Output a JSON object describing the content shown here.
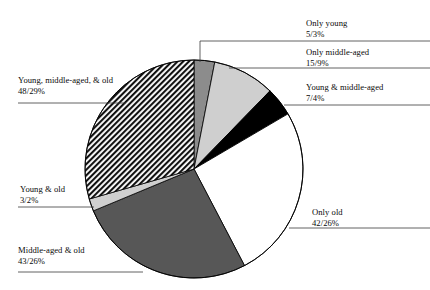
{
  "chart_data": {
    "type": "pie",
    "title": "",
    "total": 163,
    "value_format": "count/percent",
    "legend": "callout-labels",
    "grid": false,
    "categories": [
      "Only young",
      "Only middle-aged",
      "Young & middle-aged",
      "Only old",
      "Middle-aged & old",
      "Young & old",
      "Young, middle-aged, & old"
    ],
    "values": [
      5,
      15,
      7,
      42,
      43,
      3,
      48
    ],
    "percents": [
      3,
      9,
      4,
      26,
      26,
      2,
      29
    ],
    "value_labels": [
      "5/3%",
      "15/9%",
      "7/4%",
      "42/26%",
      "43/26%",
      "3/2%",
      "48/29%"
    ],
    "slices": [
      {
        "label": "Only young",
        "value": 5,
        "percent": 3,
        "value_label": "5/3%",
        "fill": "#8c8c8c",
        "pattern": "solid",
        "start_angle": 0,
        "end_angle": 11.0
      },
      {
        "label": "Only middle-aged",
        "value": 15,
        "percent": 9,
        "value_label": "15/9%",
        "fill": "#cfcfcf",
        "pattern": "solid",
        "start_angle": 11.0,
        "end_angle": 44.2
      },
      {
        "label": "Young & middle-aged",
        "value": 7,
        "percent": 4,
        "value_label": "7/4%",
        "fill": "#000000",
        "pattern": "solid",
        "start_angle": 44.2,
        "end_angle": 59.6
      },
      {
        "label": "Only old",
        "value": 42,
        "percent": 26,
        "value_label": "42/26%",
        "fill": "#ffffff",
        "pattern": "solid",
        "start_angle": 59.6,
        "end_angle": 152.4
      },
      {
        "label": "Middle-aged & old",
        "value": 43,
        "percent": 26,
        "value_label": "43/26%",
        "fill": "#575757",
        "pattern": "solid",
        "start_angle": 152.4,
        "end_angle": 247.4
      },
      {
        "label": "Young & old",
        "value": 3,
        "percent": 2,
        "value_label": "3/2%",
        "fill": "#cfcfcf",
        "pattern": "solid",
        "start_angle": 247.4,
        "end_angle": 254.0
      },
      {
        "label": "Young, middle-aged, & old",
        "value": 48,
        "percent": 29,
        "value_label": "48/29%",
        "fill": "#1a1a1a",
        "pattern": "hatch",
        "start_angle": 254.0,
        "end_angle": 360.0
      }
    ],
    "geometry": {
      "cx": 194,
      "cy": 169,
      "r": 109
    }
  },
  "labels": {
    "only_young": {
      "name": "Only young",
      "value": "5/3%"
    },
    "only_middle": {
      "name": "Only middle-aged",
      "value": "15/9%"
    },
    "young_middle": {
      "name": "Young & middle-aged",
      "value": "7/4%"
    },
    "only_old": {
      "name": "Only old",
      "value": "42/26%"
    },
    "young_mid_old": {
      "name": "Young, middle-aged, & old",
      "value": "48/29%"
    },
    "young_old": {
      "name": "Young & old",
      "value": "3/2%"
    },
    "middle_old": {
      "name": "Middle-aged & old",
      "value": "43/26%"
    }
  },
  "colors": {
    "background": "#ffffff",
    "text": "#0a0a0a",
    "outline": "#000000",
    "leader_line": "#3a3a3a",
    "slice_only_young": "#8c8c8c",
    "slice_only_middle": "#cfcfcf",
    "slice_young_middle": "#000000",
    "slice_only_old": "#ffffff",
    "slice_middle_old": "#575757",
    "slice_young_old": "#cfcfcf",
    "slice_young_mid_old": "#1a1a1a"
  }
}
